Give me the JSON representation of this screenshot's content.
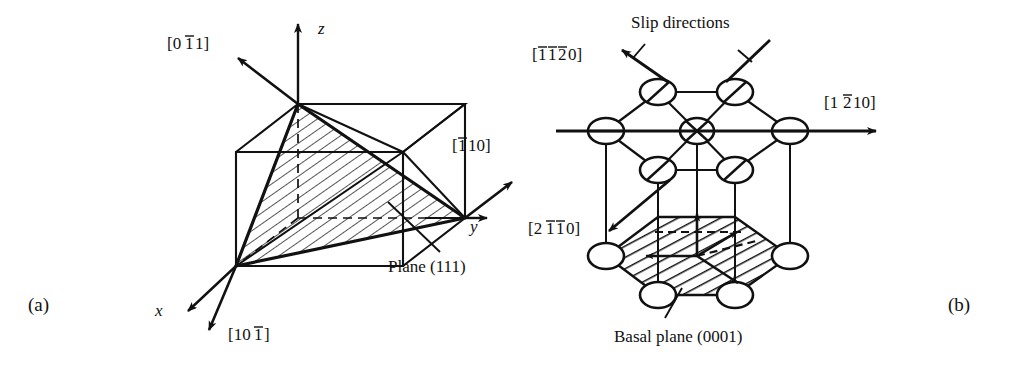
{
  "figure": {
    "panels": [
      {
        "id": "a",
        "panel_label": "(a)",
        "structure": "fcc-cube-111-plane",
        "plane_label": "Plane (111)",
        "axes": [
          {
            "name": "x-axis",
            "label": "x"
          },
          {
            "name": "y-axis",
            "label": "y"
          },
          {
            "name": "z-axis",
            "label": "z"
          }
        ],
        "directions": [
          {
            "name": "direction-0-1bar-1",
            "prefix": "[0",
            "barred": "1",
            "suffix": "1]"
          },
          {
            "name": "direction-1bar-1-0",
            "prefix": "[",
            "barred": "1",
            "suffix": "10]"
          },
          {
            "name": "direction-1-0-1bar",
            "prefix": "[10",
            "barred": "1",
            "suffix": "]"
          }
        ]
      },
      {
        "id": "b",
        "panel_label": "(b)",
        "structure": "hcp-basal-plane",
        "slip_label": "Slip directions",
        "basal_label": "Basal plane (0001)",
        "directions": [
          {
            "name": "direction-1bar-1bar-2bar-0",
            "segments": "[1,1,2]bar 0]"
          },
          {
            "name": "direction-1-2bar-1-0",
            "segments": "[1 2bar 1 0]"
          },
          {
            "name": "direction-2-1bar-1bar-0",
            "segments": "[2 1bar 1bar 0]"
          }
        ]
      }
    ],
    "colors": {
      "ink": "#111111",
      "background": "#ffffff"
    }
  }
}
